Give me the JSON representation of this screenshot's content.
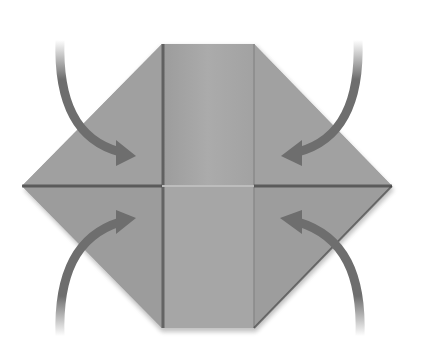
{
  "diagram": {
    "title": "",
    "colors": {
      "background": "#ffffff",
      "paper": "#9e9e9e",
      "paper_center": "#a9a9a9",
      "crease": "#5a5a5a",
      "arrow": "#6e6e6e"
    },
    "arrows": [
      {
        "name": "arrow-top-left",
        "direction": "down-right toward center"
      },
      {
        "name": "arrow-top-right",
        "direction": "down-left toward center"
      },
      {
        "name": "arrow-bottom-left",
        "direction": "up-right toward center"
      },
      {
        "name": "arrow-bottom-right",
        "direction": "up-left toward center"
      }
    ]
  }
}
